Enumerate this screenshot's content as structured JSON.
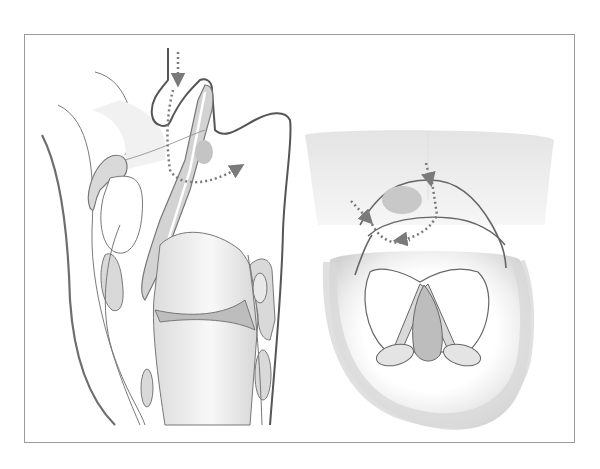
{
  "figure": {
    "type": "anatomical-illustration",
    "panels": [
      {
        "id": "left",
        "view": "sagittal-section"
      },
      {
        "id": "right",
        "view": "superior-endoscopic-view"
      }
    ],
    "arrows": {
      "style": "dotted",
      "count_left": 1,
      "count_right": 2
    },
    "colors": {
      "outline": "#6e6e6e",
      "frame": "#9a9a9a",
      "fill_light": "#e6e6e6",
      "fill_mid": "#cfcfcf",
      "fill_dark": "#b8b8b8",
      "arrow": "#7a7a7a",
      "background": "#ffffff"
    }
  },
  "caption": {
    "text": ""
  }
}
